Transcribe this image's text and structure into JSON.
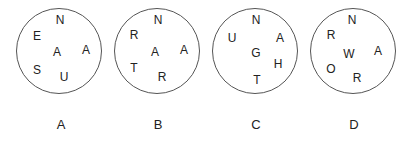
{
  "options": [
    {
      "label": "A",
      "letters": {
        "top": "N",
        "upper_left": "E",
        "center": "A",
        "right": "A",
        "lower_left": "S",
        "bottom": "U"
      }
    },
    {
      "label": "B",
      "letters": {
        "top": "N",
        "upper_left": "R",
        "center": "A",
        "right": "A",
        "lower_left": "T",
        "bottom": "R"
      }
    },
    {
      "label": "C",
      "letters": {
        "top": "N",
        "upper_left": "U",
        "center": "G",
        "upper_right": "A",
        "lower_right": "H",
        "bottom": "T"
      }
    },
    {
      "label": "D",
      "letters": {
        "top": "N",
        "upper_left": "R",
        "center": "W",
        "right": "A",
        "lower_left": "O",
        "bottom": "R"
      }
    }
  ],
  "colors": {
    "stroke": "#555555",
    "text": "#222222",
    "background": "#ffffff"
  }
}
